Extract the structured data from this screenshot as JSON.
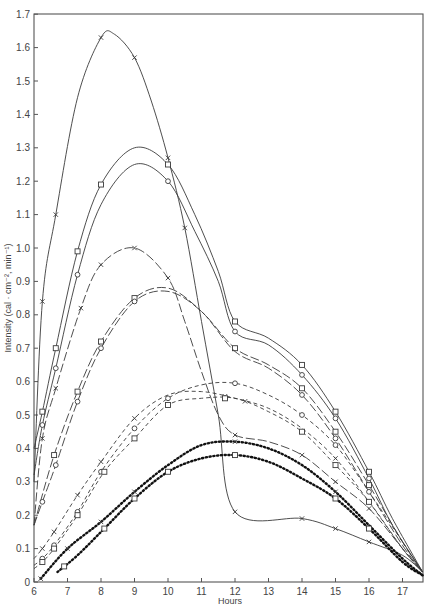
{
  "chart_data": {
    "type": "line",
    "title": "",
    "xlabel": "Hours",
    "ylabel": "Intensity  (cal · cm⁻², min⁻¹)",
    "xlim": [
      6,
      17.65
    ],
    "ylim": [
      0,
      1.7
    ],
    "grid": false,
    "legend": null,
    "x_ticks": [
      6,
      7,
      8,
      9,
      10,
      11,
      12,
      13,
      14,
      15,
      16,
      17
    ],
    "y_ticks": [
      0,
      0.1,
      0.2,
      0.3,
      0.4,
      0.5,
      0.6,
      0.7,
      0.8,
      0.9,
      1.0,
      1.1,
      1.2,
      1.3,
      1.4,
      1.5,
      1.6,
      1.7
    ],
    "y_tick_labels": [
      "0",
      "0.1",
      "0.2",
      "0.3",
      "0.4",
      "0.5",
      "0.6",
      "0.7",
      "0.8",
      "0.9",
      "1.0",
      "1.1",
      "1.2",
      "1.3",
      "1.4",
      "1.5",
      "1.6",
      "1.7"
    ],
    "series": [
      {
        "name": "solid-x-peak",
        "style": "solid",
        "marker": "x",
        "x": [
          6,
          6.25,
          6.65,
          7.3,
          8,
          8.4,
          9,
          9.5,
          10,
          10.5,
          11,
          11.5,
          12,
          14,
          15,
          16,
          17,
          17.6
        ],
        "y": [
          0.3,
          0.84,
          1.1,
          1.45,
          1.63,
          1.64,
          1.57,
          1.44,
          1.27,
          1.06,
          0.78,
          0.5,
          0.21,
          0.19,
          0.16,
          0.12,
          0.08,
          0.03
        ],
        "markers_at": [
          6.25,
          6.65,
          8,
          9,
          10,
          10.5,
          12,
          14,
          15,
          16
        ]
      },
      {
        "name": "solid-square-upper",
        "style": "solid",
        "marker": "square",
        "x": [
          6,
          6.25,
          6.65,
          7.3,
          8,
          9,
          10,
          10.8,
          11.5,
          12,
          13,
          14,
          15,
          16,
          16.7,
          17.6
        ],
        "y": [
          0.4,
          0.51,
          0.7,
          0.99,
          1.19,
          1.3,
          1.25,
          1.1,
          0.93,
          0.78,
          0.73,
          0.65,
          0.51,
          0.33,
          0.19,
          0.03
        ],
        "markers_at": [
          6.25,
          6.65,
          7.3,
          8,
          10,
          12,
          14,
          15,
          16
        ]
      },
      {
        "name": "solid-circle",
        "style": "solid",
        "marker": "circle",
        "x": [
          6,
          6.25,
          6.65,
          7.3,
          8,
          9,
          10,
          10.8,
          11.5,
          12,
          13,
          14,
          15,
          16,
          16.7,
          17.6
        ],
        "y": [
          0.32,
          0.47,
          0.64,
          0.92,
          1.13,
          1.25,
          1.2,
          1.05,
          0.9,
          0.75,
          0.71,
          0.62,
          0.49,
          0.31,
          0.17,
          0.03
        ],
        "markers_at": [
          6.25,
          6.65,
          7.3,
          10,
          12,
          14,
          15,
          16
        ]
      },
      {
        "name": "long-dash-x",
        "style": "longdash",
        "marker": "x",
        "x": [
          6,
          6.25,
          6.65,
          7.4,
          8,
          9,
          10,
          10.5,
          11,
          11.5,
          12,
          13,
          14,
          15,
          16,
          17,
          17.6
        ],
        "y": [
          0.17,
          0.43,
          0.58,
          0.82,
          0.95,
          1.0,
          0.91,
          0.78,
          0.63,
          0.5,
          0.44,
          0.42,
          0.38,
          0.3,
          0.22,
          0.1,
          0.03
        ],
        "markers_at": [
          6.25,
          6.65,
          7.4,
          8,
          9,
          10,
          12,
          14,
          15,
          16
        ]
      },
      {
        "name": "long-dash-square",
        "style": "longdash",
        "marker": "square",
        "x": [
          6,
          6.6,
          7.3,
          8,
          9,
          10,
          11,
          12,
          13,
          14,
          15,
          16,
          17,
          17.6
        ],
        "y": [
          0.17,
          0.38,
          0.57,
          0.72,
          0.85,
          0.88,
          0.81,
          0.7,
          0.65,
          0.58,
          0.45,
          0.29,
          0.12,
          0.03
        ],
        "markers_at": [
          6.6,
          7.3,
          8,
          9,
          12,
          14,
          15,
          16
        ]
      },
      {
        "name": "long-dash-circle",
        "style": "longdash",
        "marker": "circle",
        "x": [
          6,
          6.25,
          6.65,
          7.3,
          8,
          9,
          10,
          11,
          12,
          13,
          14,
          15,
          16,
          17,
          17.6
        ],
        "y": [
          0.17,
          0.24,
          0.35,
          0.54,
          0.7,
          0.84,
          0.87,
          0.81,
          0.69,
          0.64,
          0.56,
          0.43,
          0.27,
          0.11,
          0.03
        ],
        "markers_at": [
          6.25,
          6.65,
          7.3,
          8,
          9,
          14,
          15
        ]
      },
      {
        "name": "short-dash-x",
        "style": "shortdash",
        "marker": "x",
        "x": [
          6,
          6.25,
          6.6,
          7.3,
          8,
          9,
          10,
          11,
          12,
          13,
          14,
          15,
          16,
          17,
          17.6
        ],
        "y": [
          0.07,
          0.1,
          0.15,
          0.26,
          0.36,
          0.49,
          0.56,
          0.57,
          0.55,
          0.52,
          0.46,
          0.37,
          0.24,
          0.1,
          0.03
        ],
        "markers_at": [
          6.25,
          6.6,
          7.3,
          8,
          9,
          11.7,
          12.3,
          15,
          16
        ]
      },
      {
        "name": "short-dash-circle",
        "style": "shortdash",
        "marker": "circle",
        "x": [
          6,
          6.25,
          6.6,
          7.3,
          8,
          9,
          10,
          11,
          12,
          13,
          14,
          15,
          16,
          17,
          17.6
        ],
        "y": [
          0.05,
          0.07,
          0.11,
          0.21,
          0.33,
          0.46,
          0.55,
          0.59,
          0.595,
          0.56,
          0.5,
          0.41,
          0.27,
          0.12,
          0.03
        ],
        "markers_at": [
          6.25,
          6.6,
          7.3,
          8,
          9,
          10,
          12,
          14,
          15,
          16
        ]
      },
      {
        "name": "short-dash-square",
        "style": "shortdash",
        "marker": "square",
        "x": [
          6,
          6.25,
          6.6,
          7.3,
          8.1,
          9,
          10,
          11,
          12,
          13,
          14,
          15,
          16,
          17,
          17.6
        ],
        "y": [
          0.04,
          0.06,
          0.1,
          0.2,
          0.33,
          0.43,
          0.53,
          0.55,
          0.55,
          0.51,
          0.45,
          0.35,
          0.24,
          0.1,
          0.03
        ],
        "markers_at": [
          6.25,
          6.6,
          7.3,
          8.1,
          9,
          10,
          11.7,
          14,
          15,
          16
        ]
      },
      {
        "name": "dotted-x",
        "style": "dotted",
        "marker": "x",
        "x": [
          6.2,
          7,
          8,
          9,
          10,
          11,
          12,
          13,
          14,
          15,
          16,
          17,
          17.6
        ],
        "y": [
          0.01,
          0.1,
          0.18,
          0.27,
          0.35,
          0.41,
          0.42,
          0.4,
          0.35,
          0.27,
          0.17,
          0.07,
          0.02
        ],
        "markers_at": [
          6.2,
          7,
          8,
          9,
          12,
          15
        ]
      },
      {
        "name": "dotted-square",
        "style": "dotted",
        "marker": "square",
        "x": [
          6.7,
          7.3,
          8.1,
          9,
          10,
          11,
          12,
          13,
          14,
          15,
          16,
          17,
          17.6
        ],
        "y": [
          0.03,
          0.08,
          0.16,
          0.25,
          0.33,
          0.37,
          0.38,
          0.36,
          0.31,
          0.25,
          0.16,
          0.06,
          0.02
        ],
        "markers_at": [
          6.9,
          8.1,
          9,
          10,
          12,
          15,
          16
        ]
      }
    ]
  },
  "axes": {
    "x_title": "Hours",
    "y_title": "Intensity  (cal · cm⁻², min⁻¹)"
  }
}
